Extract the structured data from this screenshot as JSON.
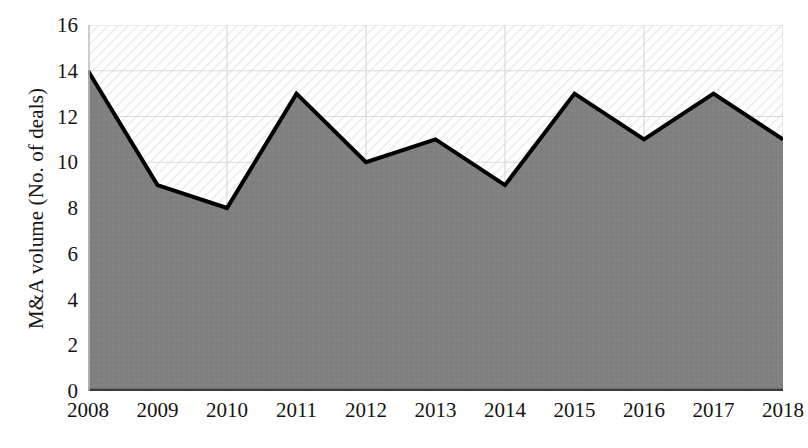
{
  "chart_data": {
    "type": "area",
    "title": "",
    "subtitle": "",
    "xlabel": "",
    "ylabel": "M&A volume (No. of deals)",
    "categories": [
      "2008",
      "2009",
      "2010",
      "2011",
      "2012",
      "2013",
      "2014",
      "2015",
      "2016",
      "2017",
      "2018"
    ],
    "values": [
      14,
      9,
      8,
      13,
      10,
      11,
      9,
      13,
      11,
      13,
      11
    ],
    "series": [
      {
        "name": "M&A volume",
        "values": [
          14,
          9,
          8,
          13,
          10,
          11,
          9,
          13,
          11,
          13,
          11
        ]
      }
    ],
    "ylim": [
      0,
      16
    ],
    "ytick_step": 2,
    "yticks": [
      "16",
      "14",
      "12",
      "10",
      "8",
      "6",
      "4",
      "2",
      "0"
    ],
    "ytick_values": [
      16,
      14,
      12,
      10,
      8,
      6,
      4,
      2,
      0
    ],
    "xticks": [
      "2008",
      "2009",
      "2010",
      "2011",
      "2012",
      "2013",
      "2014",
      "2015",
      "2016",
      "2017",
      "2018"
    ],
    "grid": true,
    "legend": false,
    "legend_position": "none",
    "annotations": [],
    "colors": {
      "area_fill": "#808080",
      "line": "#000000",
      "gridline": "#d9d9d9",
      "axis": "#404040",
      "plot_background": "#ffffff",
      "hatch": "#e8e8e8",
      "text": "#141414"
    },
    "line_width_px": 4
  }
}
